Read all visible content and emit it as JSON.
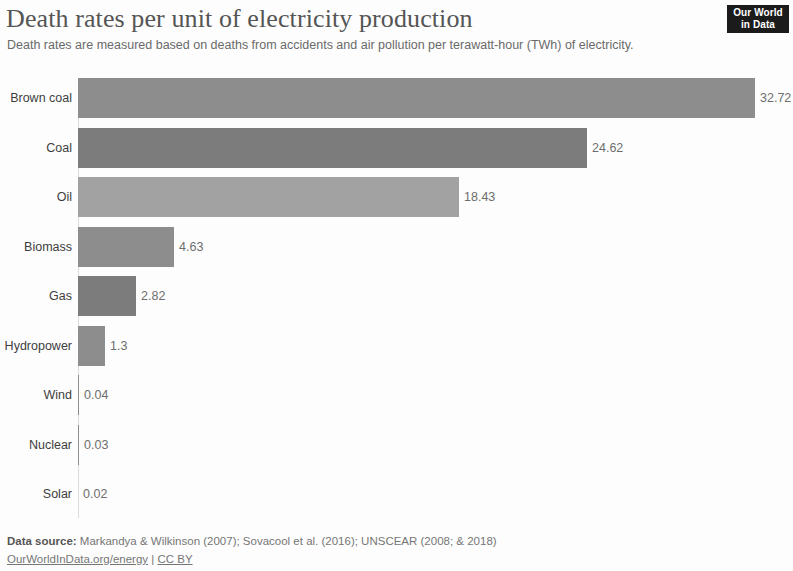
{
  "header": {
    "title": "Death rates per unit of electricity production",
    "subtitle": "Death rates are measured based on deaths from accidents and air pollution per terawatt-hour (TWh) of electricity."
  },
  "logo": {
    "line1": "Our World",
    "line2": "in Data"
  },
  "footer": {
    "source_label": "Data source:",
    "source_text": " Markandya & Wilkinson (2007); Sovacool et al. (2016); UNSCEAR (2008; & 2018)",
    "link_site": "OurWorldInData.org/energy",
    "separator": " | ",
    "link_license": "CC BY"
  },
  "chart_data": {
    "type": "bar",
    "orientation": "horizontal",
    "title": "Death rates per unit of electricity production",
    "subtitle": "Death rates are measured based on deaths from accidents and air pollution per terawatt-hour (TWh) of electricity.",
    "xlabel": "",
    "ylabel": "",
    "xlim": [
      0,
      32.72
    ],
    "grid": false,
    "legend": "none",
    "categories": [
      "Brown coal",
      "Coal",
      "Oil",
      "Biomass",
      "Gas",
      "Hydropower",
      "Wind",
      "Nuclear",
      "Solar"
    ],
    "values": [
      32.72,
      24.62,
      18.43,
      4.63,
      2.82,
      1.3,
      0.04,
      0.03,
      0.02
    ],
    "value_labels": [
      "32.72",
      "24.62",
      "18.43",
      "4.63",
      "2.82",
      "1.3",
      "0.04",
      "0.03",
      "0.02"
    ],
    "bar_colors": [
      "#8d8d8d",
      "#7c7c7c",
      "#a2a2a2",
      "#8d8d8d",
      "#7c7c7c",
      "#8d8d8d",
      "#8d8d8d",
      "#8d8d8d",
      "#8d8d8d"
    ]
  }
}
